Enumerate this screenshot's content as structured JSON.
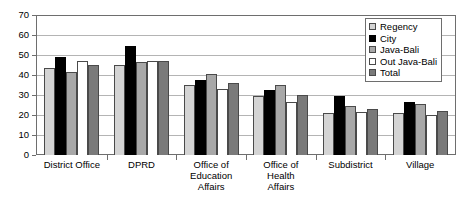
{
  "chart_data": {
    "type": "bar",
    "title": "",
    "xlabel": "",
    "ylabel": "",
    "ylim": [
      0,
      70
    ],
    "yticks": [
      0,
      10,
      20,
      30,
      40,
      50,
      60,
      70
    ],
    "grid": true,
    "legend_position": "top-right",
    "categories": [
      "District Office",
      "DPRD",
      "Office of\nEducation\nAffairs",
      "Office of\nHealth\nAffairs",
      "Subdistrict",
      "Village"
    ],
    "series": [
      {
        "name": "Regency",
        "color": "#d4d4d4",
        "values": [
          44.0,
          45.5,
          35.5,
          29.5,
          21.0,
          21.0
        ]
      },
      {
        "name": "City",
        "color": "#000000",
        "values": [
          49.5,
          55.0,
          38.0,
          32.5,
          29.5,
          26.5
        ]
      },
      {
        "name": "Java-Bali",
        "color": "#a8a8a8",
        "values": [
          42.0,
          47.0,
          41.0,
          35.5,
          24.5,
          25.5
        ]
      },
      {
        "name": "Out Java-Bali",
        "color": "#ffffff",
        "values": [
          47.5,
          47.5,
          33.0,
          26.5,
          21.5,
          20.0
        ]
      },
      {
        "name": "Total",
        "color": "#7a7a7a",
        "values": [
          45.5,
          47.5,
          36.5,
          30.0,
          23.0,
          22.0
        ]
      }
    ]
  },
  "legend": {
    "items": [
      {
        "label": "Regency"
      },
      {
        "label": "City"
      },
      {
        "label": "Java-Bali"
      },
      {
        "label": "Out Java-Bali"
      },
      {
        "label": "Total"
      }
    ]
  },
  "colors": {
    "axis": "#6e6e6e",
    "gridline": "#b4b4b4",
    "bar_outline": "#4a4a4a",
    "background": "#ffffff"
  }
}
